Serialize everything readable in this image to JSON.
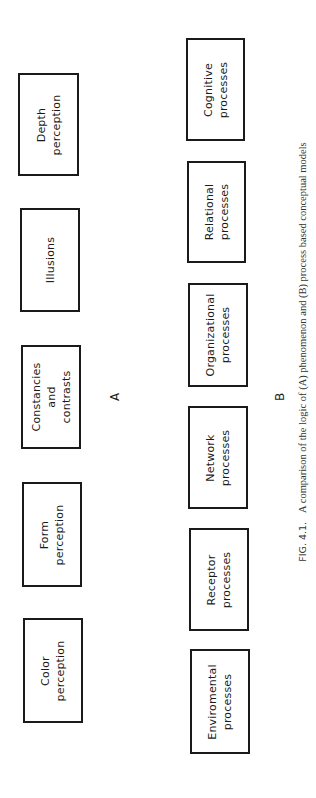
{
  "diagram": {
    "row_a": {
      "label": "A",
      "boxes": [
        {
          "text": "Color\nperception"
        },
        {
          "text": "Form\nperception"
        },
        {
          "text": "Constancies\nand\ncontrasts"
        },
        {
          "text": "Illusions"
        },
        {
          "text": "Depth\nperception"
        }
      ]
    },
    "row_b": {
      "label": "B",
      "boxes": [
        {
          "text": "Enviromental\nprocesses"
        },
        {
          "text": "Receptor\nprocesses"
        },
        {
          "text": "Network\nprocesses"
        },
        {
          "text": "Organizational\nprocesses"
        },
        {
          "text": "Relational\nprocesses"
        },
        {
          "text": "Cognitive\nprocesses"
        }
      ]
    }
  },
  "caption": {
    "fig_number": "FIG. 4.1.",
    "text": "A comparison of the logic of (A) phenomenon and (B) process based conceptual models"
  }
}
